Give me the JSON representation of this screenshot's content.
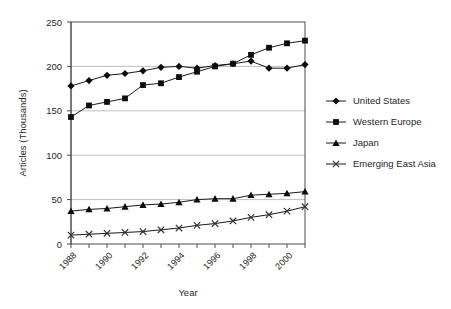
{
  "chart_data": {
    "type": "line",
    "title": "",
    "xlabel": "Year",
    "ylabel": "Articles (Thousands)",
    "grid": "horizontal",
    "legend_position": "right",
    "xlim": [
      1988,
      2001
    ],
    "ylim": [
      0,
      250
    ],
    "ytick_values": [
      0,
      50,
      100,
      150,
      200,
      250
    ],
    "ytick_labels": [
      "0",
      "50",
      "100",
      "150",
      "200",
      "250"
    ],
    "x": [
      1988,
      1989,
      1990,
      1991,
      1992,
      1993,
      1994,
      1995,
      1996,
      1997,
      1998,
      1999,
      2000,
      2001
    ],
    "xtick_labels": [
      "1988",
      "",
      "1990",
      "",
      "1992",
      "",
      "1994",
      "",
      "1996",
      "",
      "1998",
      "",
      "2000",
      ""
    ],
    "series": [
      {
        "name": "United States",
        "marker": "diamond",
        "values": [
          178,
          184,
          190,
          192,
          195,
          199,
          200,
          198,
          201,
          203,
          206,
          198,
          198,
          202
        ]
      },
      {
        "name": "Western Europe",
        "marker": "square",
        "values": [
          143,
          156,
          160,
          164,
          179,
          181,
          188,
          194,
          200,
          203,
          213,
          221,
          226,
          229
        ]
      },
      {
        "name": "Japan",
        "marker": "triangle",
        "values": [
          37,
          39,
          40,
          42,
          44,
          45,
          47,
          50,
          51,
          51,
          55,
          56,
          57,
          59
        ]
      },
      {
        "name": "Emerging East Asia",
        "marker": "x",
        "values": [
          10,
          11,
          12,
          13,
          14,
          16,
          18,
          21,
          23,
          26,
          30,
          33,
          37,
          42
        ]
      }
    ]
  },
  "legend": {
    "entries": [
      {
        "label": "United States",
        "marker": "diamond"
      },
      {
        "label": "Western Europe",
        "marker": "square"
      },
      {
        "label": "Japan",
        "marker": "triangle"
      },
      {
        "label": "Emerging East Asia",
        "marker": "x"
      }
    ]
  },
  "colors": {
    "marker": "#0d0d0d",
    "line": "#1a1a1a",
    "grid": "#bfbfbf",
    "axis": "#4d4d4d",
    "text": "#262626",
    "background": "#ffffff"
  }
}
